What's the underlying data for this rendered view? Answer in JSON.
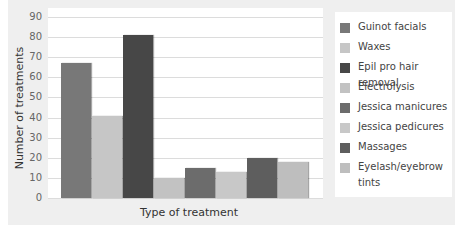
{
  "chart_data": {
    "type": "bar",
    "title": "",
    "xlabel": "Type of treatment",
    "ylabel": "Number of treatments",
    "ylim": [
      0,
      90
    ],
    "yticks": [
      0,
      10,
      20,
      30,
      40,
      50,
      60,
      70,
      80,
      90
    ],
    "grid": true,
    "legend_position": "right",
    "categories": [
      "Guinot facials",
      "Waxes",
      "Epil pro hair removal",
      "Electrolysis",
      "Jessica manicures",
      "Jessica pedicures",
      "Massages",
      "Eyelash/eyebrow tints"
    ],
    "values": [
      67,
      41,
      81,
      10,
      15,
      13,
      20,
      18
    ],
    "colors": [
      "#787878",
      "#c6c6c6",
      "#474747",
      "#c2c2c2",
      "#6c6c6c",
      "#c8c8c8",
      "#5e5e5e",
      "#bebebe"
    ]
  },
  "legend": {
    "items": [
      {
        "label": "Guinot facials",
        "color": "#787878"
      },
      {
        "label": "Waxes",
        "color": "#c6c6c6"
      },
      {
        "label": "Epil pro hair removal",
        "color": "#474747"
      },
      {
        "label": "Electrolysis",
        "color": "#c2c2c2"
      },
      {
        "label": "Jessica manicures",
        "color": "#6c6c6c"
      },
      {
        "label": "Jessica pedicures",
        "color": "#c8c8c8"
      },
      {
        "label": "Massages",
        "color": "#5e5e5e"
      },
      {
        "label": "Eyelash/eyebrow tints",
        "color": "#bebebe"
      }
    ]
  }
}
